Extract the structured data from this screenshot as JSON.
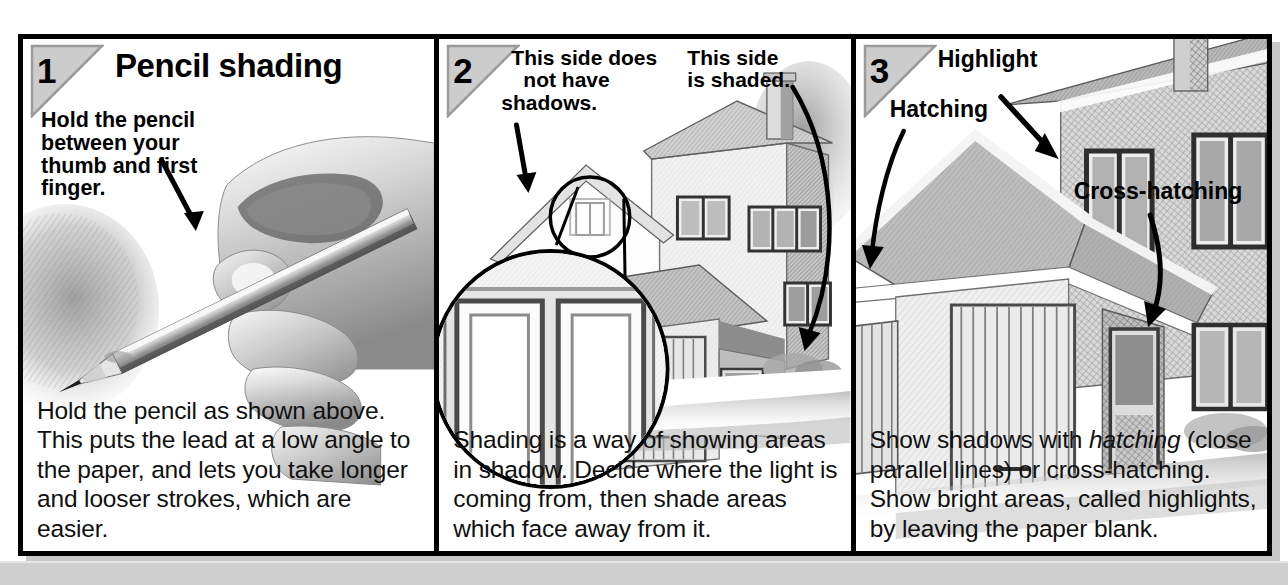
{
  "page": {
    "kind": "instructional-illustration-strip",
    "panel_count": 3,
    "background_color": "#ffffff",
    "frame_color": "#000000",
    "badge_fill": "#cccccc",
    "bottom_band_color": "#cfcfcf"
  },
  "panels": [
    {
      "number": "1",
      "title": "Pencil shading",
      "callouts": [
        {
          "name": "hold-pencil-callout",
          "text": "Hold the pencil\nbetween your\nthumb and first\nfinger."
        }
      ],
      "illustration": "photo of a hand holding a pencil at a low angle, shading a patch of paper",
      "body": "Hold the pencil as shown above. This puts the lead at a low angle to the paper, and lets you take longer and looser strokes, which are easier."
    },
    {
      "number": "2",
      "title": "",
      "callouts": [
        {
          "name": "unshaded-side-callout",
          "text": "This side does\nnot have\nshadows."
        },
        {
          "name": "shaded-side-callout",
          "text": "This side\nis shaded."
        }
      ],
      "illustration": "pencil drawing of a house with a magnified detail circle on the garage doors",
      "body": "Shading is a way of showing areas in shadow. Decide where the light is coming from, then shade areas which face away from it."
    },
    {
      "number": "3",
      "title": "",
      "callouts": [
        {
          "name": "highlight-callout",
          "text": "Highlight"
        },
        {
          "name": "hatching-callout",
          "text": "Hatching"
        },
        {
          "name": "cross-hatching-callout",
          "text": "Cross-hatching"
        }
      ],
      "illustration": "close-up pencil drawing of a house garage showing hatching, cross-hatching and highlights",
      "body_parts": [
        {
          "text": "Show shadows with ",
          "style": "normal"
        },
        {
          "text": "hatching",
          "style": "italic"
        },
        {
          "text": " (close parallel lines) or cross-hatching. Show bright areas, called highlights, by leaving the paper blank.",
          "style": "normal"
        }
      ],
      "body": "Show shadows with hatching (close parallel lines) or cross-hatching. Show bright areas, called highlights, by leaving the paper blank."
    }
  ]
}
